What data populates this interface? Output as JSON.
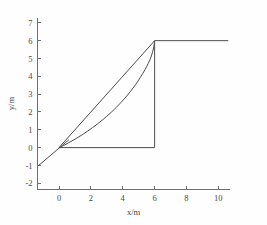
{
  "chart_data": {
    "type": "line",
    "title": "",
    "subtitle": "",
    "xlabel": "x/m",
    "ylabel": "y/m",
    "xlim": [
      -1.35,
      10.7
    ],
    "ylim": [
      -2.35,
      7.3
    ],
    "xticks": [
      0,
      2,
      4,
      6,
      8,
      10
    ],
    "xtick_labels": [
      "0",
      "2",
      "4",
      "6",
      "8",
      "10"
    ],
    "yticks": [
      -2,
      -1,
      0,
      1,
      2,
      3,
      4,
      5,
      6,
      7
    ],
    "ytick_labels": [
      "-2",
      "-1",
      "0",
      "1",
      "2",
      "3",
      "4",
      "5",
      "6",
      "7"
    ],
    "grid": false,
    "legend": null,
    "legend_position": "none",
    "line_color": "#4d4d4d",
    "axis_color": "#6e6e6e",
    "background_color": "#fefefe",
    "series": [
      {
        "name": "incline-ray",
        "kind": "straight-segment",
        "description": "straight ray entering from lower left through origin",
        "points": [
          [
            -1.3,
            -1.02
          ],
          [
            0.0,
            -0.03
          ],
          [
            0.62,
            0.44
          ]
        ]
      },
      {
        "name": "chord",
        "kind": "straight-segment",
        "description": "straight chord from origin to corner point",
        "points": [
          [
            0.0,
            0.0
          ],
          [
            6.0,
            6.0
          ]
        ]
      },
      {
        "name": "curve",
        "kind": "curve",
        "description": "convex rising curve from origin to corner point, sagging below the chord",
        "points": [
          [
            0.0,
            0.0
          ],
          [
            0.3,
            0.12
          ],
          [
            0.6,
            0.27
          ],
          [
            0.9,
            0.42
          ],
          [
            1.2,
            0.58
          ],
          [
            1.5,
            0.75
          ],
          [
            1.8,
            0.93
          ],
          [
            2.1,
            1.12
          ],
          [
            2.4,
            1.32
          ],
          [
            2.7,
            1.53
          ],
          [
            3.0,
            1.76
          ],
          [
            3.3,
            2.0
          ],
          [
            3.6,
            2.26
          ],
          [
            3.9,
            2.54
          ],
          [
            4.2,
            2.84
          ],
          [
            4.5,
            3.17
          ],
          [
            4.8,
            3.53
          ],
          [
            5.1,
            3.93
          ],
          [
            5.4,
            4.38
          ],
          [
            5.6,
            4.72
          ],
          [
            5.75,
            5.02
          ],
          [
            5.87,
            5.35
          ],
          [
            5.95,
            5.66
          ],
          [
            6.0,
            6.0
          ]
        ]
      },
      {
        "name": "baseline",
        "kind": "straight-segment",
        "description": "horizontal base segment at y equals zero",
        "points": [
          [
            0.0,
            0.0
          ],
          [
            6.0,
            0.0
          ]
        ]
      },
      {
        "name": "riser",
        "kind": "straight-segment",
        "description": "vertical segment at x equals six",
        "points": [
          [
            6.0,
            0.0
          ],
          [
            6.0,
            6.0
          ]
        ]
      },
      {
        "name": "plateau",
        "kind": "straight-segment",
        "description": "horizontal plateau at y equals six",
        "points": [
          [
            6.0,
            6.0
          ],
          [
            10.62,
            6.0
          ]
        ]
      }
    ]
  }
}
